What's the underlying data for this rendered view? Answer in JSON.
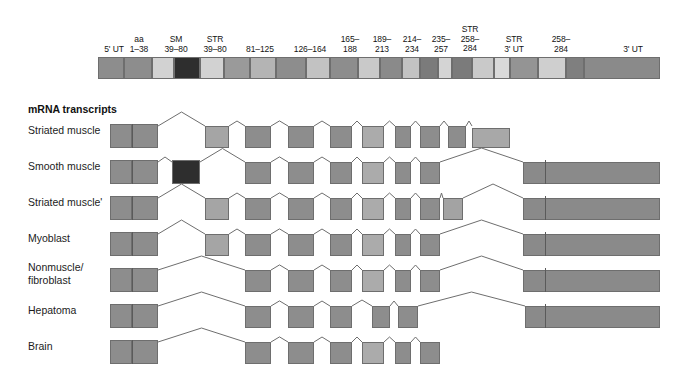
{
  "figure": {
    "type": "gene-structure-alternative-splicing-diagram",
    "section_title": "mRNA transcripts"
  },
  "colors": {
    "mid_gray": "#8d8d8d",
    "dark_gray": "#7b7b7b",
    "light_gray": "#c9c9c9",
    "pale_gray": "#d9d9d9",
    "very_dark": "#3a3a3a",
    "sm_exon": "#2e2e2e",
    "outline": "#6e6e6e",
    "utr_gray": "#8a8a8a"
  },
  "gene": {
    "x": 98,
    "y": 57,
    "width": 562,
    "height": 22,
    "labels": [
      {
        "text": "5' UT",
        "cx": 114,
        "y": 45,
        "w": 40
      },
      {
        "text": "aa\n1–38",
        "cx": 139,
        "y": 35,
        "w": 34
      },
      {
        "text": "SM\n39–80",
        "cx": 176,
        "y": 35,
        "w": 38
      },
      {
        "text": "STR\n39–80",
        "cx": 215,
        "y": 35,
        "w": 40
      },
      {
        "text": "81–125",
        "cx": 260,
        "y": 45,
        "w": 42
      },
      {
        "text": "126–164",
        "cx": 310,
        "y": 45,
        "w": 46
      },
      {
        "text": "165–\n188",
        "cx": 350,
        "y": 35,
        "w": 34
      },
      {
        "text": "189–\n213",
        "cx": 382,
        "y": 35,
        "w": 34
      },
      {
        "text": "214–\n234",
        "cx": 412,
        "y": 35,
        "w": 34
      },
      {
        "text": "235–\n257",
        "cx": 441,
        "y": 35,
        "w": 34
      },
      {
        "text": "STR\n258–\n284",
        "cx": 470,
        "y": 25,
        "w": 36
      },
      {
        "text": "STR\n3' UT",
        "cx": 514,
        "y": 35,
        "w": 42
      },
      {
        "text": "258–\n284",
        "cx": 561,
        "y": 35,
        "w": 34
      },
      {
        "text": "3' UT",
        "cx": 633,
        "y": 45,
        "w": 38
      }
    ],
    "exons": [
      {
        "id": "g1",
        "x": 98,
        "w": 26,
        "fill": "#8d8d8d",
        "name": "exon-5utr-a"
      },
      {
        "id": "g2",
        "x": 124,
        "w": 28,
        "fill": "#8d8d8d",
        "name": "exon-aa-1-38"
      },
      {
        "id": "g3",
        "x": 152,
        "w": 22,
        "fill": "#d2d2d2",
        "name": "intron-block-1"
      },
      {
        "id": "g4",
        "x": 174,
        "w": 26,
        "fill": "#2e2e2e",
        "name": "exon-sm-39-80"
      },
      {
        "id": "g5",
        "x": 200,
        "w": 24,
        "fill": "#d2d2d2",
        "name": "exon-str-39-80"
      },
      {
        "id": "g6",
        "x": 224,
        "w": 26,
        "fill": "#9a9a9a",
        "name": "spacer-1"
      },
      {
        "id": "g7",
        "x": 250,
        "w": 26,
        "fill": "#b4b4b4",
        "name": "exon-81-125"
      },
      {
        "id": "g8",
        "x": 276,
        "w": 30,
        "fill": "#8d8d8d",
        "name": "spacer-2"
      },
      {
        "id": "g9",
        "x": 306,
        "w": 24,
        "fill": "#c2c2c2",
        "name": "exon-126-164"
      },
      {
        "id": "g10",
        "x": 330,
        "w": 28,
        "fill": "#8d8d8d",
        "name": "exon-165-188"
      },
      {
        "id": "g11",
        "x": 358,
        "w": 22,
        "fill": "#c9c9c9",
        "name": "spacer-3"
      },
      {
        "id": "g12",
        "x": 380,
        "w": 22,
        "fill": "#8a8a8a",
        "name": "exon-189-213"
      },
      {
        "id": "g13",
        "x": 402,
        "w": 18,
        "fill": "#c2c2c2",
        "name": "spacer-4"
      },
      {
        "id": "g14",
        "x": 420,
        "w": 18,
        "fill": "#7b7b7b",
        "name": "exon-214-234"
      },
      {
        "id": "g15",
        "x": 438,
        "w": 14,
        "fill": "#d4d4d4",
        "name": "spacer-5"
      },
      {
        "id": "g16",
        "x": 452,
        "w": 20,
        "fill": "#7b7b7b",
        "name": "exon-235-257"
      },
      {
        "id": "g17",
        "x": 472,
        "w": 22,
        "fill": "#c9c9c9",
        "name": "exon-str-258-284"
      },
      {
        "id": "g18",
        "x": 494,
        "w": 16,
        "fill": "#d9d9d9",
        "name": "spacer-6"
      },
      {
        "id": "g19",
        "x": 510,
        "w": 28,
        "fill": "#949494",
        "name": "exon-str-3utr"
      },
      {
        "id": "g20",
        "x": 538,
        "w": 28,
        "fill": "#cfcfcf",
        "name": "exon-258-284"
      },
      {
        "id": "g21",
        "x": 566,
        "w": 18,
        "fill": "#7f7f7f",
        "name": "spacer-7"
      },
      {
        "id": "g22",
        "x": 584,
        "w": 76,
        "fill": "#8a8a8a",
        "name": "exon-3utr"
      }
    ]
  },
  "transcripts": [
    {
      "label": "Striated muscle",
      "name": "transcript-striated-muscle",
      "label_x": 28,
      "label_y": 131,
      "row_y": 124,
      "box_h": 24,
      "boxes": [
        {
          "x": 110,
          "w": 22,
          "fill": "#8d8d8d",
          "h": 24,
          "top": 124
        },
        {
          "x": 132,
          "w": 26,
          "fill": "#8d8d8d",
          "h": 24,
          "top": 124
        },
        {
          "x": 205,
          "w": 24,
          "fill": "#a5a5a5",
          "h": 22,
          "top": 126
        },
        {
          "x": 245,
          "w": 26,
          "fill": "#8d8d8d",
          "h": 22,
          "top": 126
        },
        {
          "x": 288,
          "w": 26,
          "fill": "#8d8d8d",
          "h": 22,
          "top": 126
        },
        {
          "x": 330,
          "w": 22,
          "fill": "#8d8d8d",
          "h": 22,
          "top": 126
        },
        {
          "x": 362,
          "w": 22,
          "fill": "#ababab",
          "h": 22,
          "top": 126
        },
        {
          "x": 395,
          "w": 16,
          "fill": "#8d8d8d",
          "h": 22,
          "top": 126
        },
        {
          "x": 420,
          "w": 20,
          "fill": "#8d8d8d",
          "h": 22,
          "top": 126
        },
        {
          "x": 448,
          "w": 18,
          "fill": "#8d8d8d",
          "h": 22,
          "top": 126
        },
        {
          "x": 472,
          "w": 38,
          "fill": "#a8a8a8",
          "h": 20,
          "top": 128
        }
      ],
      "dividers": [
        132
      ],
      "introns": [
        [
          158,
          205
        ],
        [
          229,
          245
        ],
        [
          271,
          288
        ],
        [
          314,
          330
        ],
        [
          352,
          362
        ],
        [
          384,
          395
        ],
        [
          411,
          420
        ],
        [
          440,
          448
        ],
        [
          466,
          472
        ]
      ]
    },
    {
      "label": "Smooth muscle",
      "name": "transcript-smooth-muscle",
      "label_x": 28,
      "label_y": 167,
      "row_y": 160,
      "box_h": 24,
      "boxes": [
        {
          "x": 110,
          "w": 22,
          "fill": "#8d8d8d",
          "h": 24,
          "top": 160
        },
        {
          "x": 132,
          "w": 26,
          "fill": "#8d8d8d",
          "h": 24,
          "top": 160
        },
        {
          "x": 172,
          "w": 28,
          "fill": "#2e2e2e",
          "h": 24,
          "top": 160
        },
        {
          "x": 245,
          "w": 26,
          "fill": "#8d8d8d",
          "h": 22,
          "top": 162
        },
        {
          "x": 288,
          "w": 26,
          "fill": "#8d8d8d",
          "h": 22,
          "top": 162
        },
        {
          "x": 330,
          "w": 22,
          "fill": "#8d8d8d",
          "h": 22,
          "top": 162
        },
        {
          "x": 362,
          "w": 22,
          "fill": "#ababab",
          "h": 22,
          "top": 162
        },
        {
          "x": 395,
          "w": 16,
          "fill": "#8d8d8d",
          "h": 22,
          "top": 162
        },
        {
          "x": 420,
          "w": 20,
          "fill": "#8d8d8d",
          "h": 22,
          "top": 162
        },
        {
          "x": 523,
          "w": 137,
          "fill": "#8a8a8a",
          "h": 22,
          "top": 162
        }
      ],
      "dividers": [
        132,
        545
      ],
      "introns": [
        [
          158,
          172
        ],
        [
          200,
          245
        ],
        [
          271,
          288
        ],
        [
          314,
          330
        ],
        [
          352,
          362
        ],
        [
          384,
          395
        ],
        [
          411,
          420
        ],
        [
          440,
          523
        ]
      ]
    },
    {
      "label": "Striated muscle'",
      "name": "transcript-striated-muscle-prime",
      "label_x": 28,
      "label_y": 203,
      "row_y": 196,
      "box_h": 24,
      "boxes": [
        {
          "x": 110,
          "w": 22,
          "fill": "#8d8d8d",
          "h": 24,
          "top": 196
        },
        {
          "x": 132,
          "w": 26,
          "fill": "#8d8d8d",
          "h": 24,
          "top": 196
        },
        {
          "x": 205,
          "w": 24,
          "fill": "#a5a5a5",
          "h": 22,
          "top": 198
        },
        {
          "x": 245,
          "w": 26,
          "fill": "#8d8d8d",
          "h": 22,
          "top": 198
        },
        {
          "x": 288,
          "w": 26,
          "fill": "#8d8d8d",
          "h": 22,
          "top": 198
        },
        {
          "x": 330,
          "w": 22,
          "fill": "#8d8d8d",
          "h": 22,
          "top": 198
        },
        {
          "x": 362,
          "w": 22,
          "fill": "#ababab",
          "h": 22,
          "top": 198
        },
        {
          "x": 395,
          "w": 16,
          "fill": "#8d8d8d",
          "h": 22,
          "top": 198
        },
        {
          "x": 420,
          "w": 20,
          "fill": "#8d8d8d",
          "h": 22,
          "top": 198
        },
        {
          "x": 443,
          "w": 20,
          "fill": "#a3a3a3",
          "h": 22,
          "top": 198
        },
        {
          "x": 523,
          "w": 137,
          "fill": "#8a8a8a",
          "h": 22,
          "top": 198
        }
      ],
      "dividers": [
        132,
        545
      ],
      "introns": [
        [
          158,
          205
        ],
        [
          229,
          245
        ],
        [
          271,
          288
        ],
        [
          314,
          330
        ],
        [
          352,
          362
        ],
        [
          384,
          395
        ],
        [
          411,
          420
        ],
        [
          440,
          443
        ],
        [
          463,
          523
        ]
      ]
    },
    {
      "label": "Myoblast",
      "name": "transcript-myoblast",
      "label_x": 28,
      "label_y": 239,
      "row_y": 232,
      "box_h": 24,
      "boxes": [
        {
          "x": 110,
          "w": 22,
          "fill": "#8d8d8d",
          "h": 24,
          "top": 232
        },
        {
          "x": 132,
          "w": 26,
          "fill": "#8d8d8d",
          "h": 24,
          "top": 232
        },
        {
          "x": 205,
          "w": 24,
          "fill": "#a5a5a5",
          "h": 22,
          "top": 234
        },
        {
          "x": 245,
          "w": 26,
          "fill": "#8d8d8d",
          "h": 22,
          "top": 234
        },
        {
          "x": 288,
          "w": 26,
          "fill": "#8d8d8d",
          "h": 22,
          "top": 234
        },
        {
          "x": 330,
          "w": 22,
          "fill": "#8d8d8d",
          "h": 22,
          "top": 234
        },
        {
          "x": 362,
          "w": 22,
          "fill": "#ababab",
          "h": 22,
          "top": 234
        },
        {
          "x": 395,
          "w": 16,
          "fill": "#8d8d8d",
          "h": 22,
          "top": 234
        },
        {
          "x": 420,
          "w": 20,
          "fill": "#8d8d8d",
          "h": 22,
          "top": 234
        },
        {
          "x": 523,
          "w": 137,
          "fill": "#8a8a8a",
          "h": 22,
          "top": 234
        }
      ],
      "dividers": [
        132,
        545
      ],
      "introns": [
        [
          158,
          205
        ],
        [
          229,
          245
        ],
        [
          271,
          288
        ],
        [
          314,
          330
        ],
        [
          352,
          362
        ],
        [
          384,
          395
        ],
        [
          411,
          420
        ],
        [
          440,
          523
        ]
      ]
    },
    {
      "label": "Nonmuscle/\nfibroblast",
      "name": "transcript-nonmuscle-fibroblast",
      "label_x": 28,
      "label_y": 268,
      "row_y": 268,
      "box_h": 24,
      "boxes": [
        {
          "x": 110,
          "w": 22,
          "fill": "#8d8d8d",
          "h": 24,
          "top": 268
        },
        {
          "x": 132,
          "w": 26,
          "fill": "#8d8d8d",
          "h": 24,
          "top": 268
        },
        {
          "x": 245,
          "w": 26,
          "fill": "#8d8d8d",
          "h": 22,
          "top": 270
        },
        {
          "x": 288,
          "w": 26,
          "fill": "#8d8d8d",
          "h": 22,
          "top": 270
        },
        {
          "x": 330,
          "w": 22,
          "fill": "#8d8d8d",
          "h": 22,
          "top": 270
        },
        {
          "x": 362,
          "w": 22,
          "fill": "#ababab",
          "h": 22,
          "top": 270
        },
        {
          "x": 395,
          "w": 16,
          "fill": "#8d8d8d",
          "h": 22,
          "top": 270
        },
        {
          "x": 420,
          "w": 20,
          "fill": "#8d8d8d",
          "h": 22,
          "top": 270
        },
        {
          "x": 523,
          "w": 137,
          "fill": "#8a8a8a",
          "h": 22,
          "top": 270
        }
      ],
      "dividers": [
        132,
        545
      ],
      "introns": [
        [
          158,
          245
        ],
        [
          271,
          288
        ],
        [
          314,
          330
        ],
        [
          352,
          362
        ],
        [
          384,
          395
        ],
        [
          411,
          420
        ],
        [
          440,
          523
        ]
      ]
    },
    {
      "label": "Hepatoma",
      "name": "transcript-hepatoma",
      "label_x": 28,
      "label_y": 311,
      "row_y": 304,
      "box_h": 24,
      "boxes": [
        {
          "x": 110,
          "w": 22,
          "fill": "#8d8d8d",
          "h": 24,
          "top": 304
        },
        {
          "x": 132,
          "w": 26,
          "fill": "#8d8d8d",
          "h": 24,
          "top": 304
        },
        {
          "x": 245,
          "w": 26,
          "fill": "#8d8d8d",
          "h": 22,
          "top": 306
        },
        {
          "x": 288,
          "w": 26,
          "fill": "#8d8d8d",
          "h": 22,
          "top": 306
        },
        {
          "x": 330,
          "w": 22,
          "fill": "#8d8d8d",
          "h": 22,
          "top": 306
        },
        {
          "x": 372,
          "w": 18,
          "fill": "#8d8d8d",
          "h": 22,
          "top": 306
        },
        {
          "x": 398,
          "w": 20,
          "fill": "#8d8d8d",
          "h": 22,
          "top": 306
        },
        {
          "x": 525,
          "w": 135,
          "fill": "#8a8a8a",
          "h": 22,
          "top": 306
        }
      ],
      "dividers": [
        132,
        545
      ],
      "introns": [
        [
          158,
          245
        ],
        [
          271,
          288
        ],
        [
          314,
          330
        ],
        [
          352,
          372
        ],
        [
          390,
          398
        ],
        [
          418,
          525
        ]
      ]
    },
    {
      "label": "Brain",
      "name": "transcript-brain",
      "label_x": 28,
      "label_y": 347,
      "row_y": 340,
      "box_h": 24,
      "boxes": [
        {
          "x": 110,
          "w": 22,
          "fill": "#8d8d8d",
          "h": 24,
          "top": 340
        },
        {
          "x": 132,
          "w": 26,
          "fill": "#8d8d8d",
          "h": 24,
          "top": 340
        },
        {
          "x": 245,
          "w": 26,
          "fill": "#8d8d8d",
          "h": 22,
          "top": 342
        },
        {
          "x": 288,
          "w": 26,
          "fill": "#8d8d8d",
          "h": 22,
          "top": 342
        },
        {
          "x": 330,
          "w": 22,
          "fill": "#8d8d8d",
          "h": 22,
          "top": 342
        },
        {
          "x": 362,
          "w": 22,
          "fill": "#ababab",
          "h": 22,
          "top": 342
        },
        {
          "x": 395,
          "w": 16,
          "fill": "#8d8d8d",
          "h": 22,
          "top": 342
        },
        {
          "x": 420,
          "w": 20,
          "fill": "#8d8d8d",
          "h": 22,
          "top": 342
        }
      ],
      "dividers": [
        132
      ],
      "introns": [
        [
          158,
          245
        ],
        [
          271,
          288
        ],
        [
          314,
          330
        ],
        [
          352,
          362
        ],
        [
          384,
          395
        ],
        [
          411,
          420
        ]
      ]
    }
  ]
}
